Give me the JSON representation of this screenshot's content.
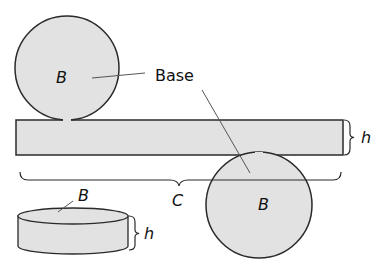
{
  "diagram": {
    "colors": {
      "fill": "#e2e2e2",
      "stroke": "#2a2a2a",
      "background": "#ffffff"
    },
    "labels": {
      "top_base": "B",
      "bottom_base": "B",
      "base_callout": "Base",
      "rect_height": "h",
      "circumference": "C",
      "cylinder_base": "B",
      "cylinder_height": "h"
    }
  }
}
